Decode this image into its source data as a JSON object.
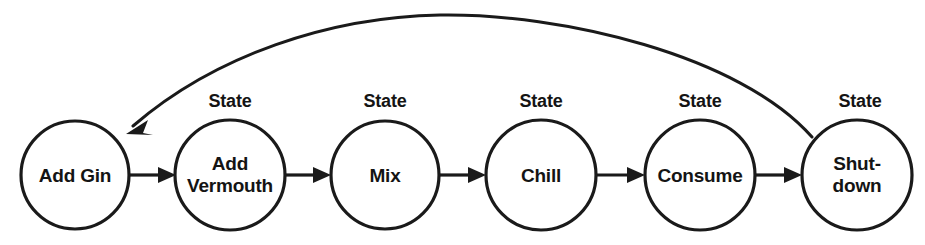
{
  "diagram": {
    "type": "state-machine",
    "title": "",
    "canvas": {
      "width": 925,
      "height": 245
    },
    "colors": {
      "background": "#ffffff",
      "stroke": "#1a1a1a",
      "text": "#141414"
    },
    "state_caption": "State",
    "nodes": [
      {
        "id": "add-gin",
        "label_lines": [
          "Add Gin"
        ],
        "caption": "",
        "has_caption": false,
        "cx": 75,
        "cy": 175,
        "r": 54
      },
      {
        "id": "add-vermouth",
        "label_lines": [
          "Add",
          "Vermouth"
        ],
        "caption": "State",
        "has_caption": true,
        "cx": 230,
        "cy": 175,
        "r": 55
      },
      {
        "id": "mix",
        "label_lines": [
          "Mix"
        ],
        "caption": "State",
        "has_caption": true,
        "cx": 385,
        "cy": 175,
        "r": 54
      },
      {
        "id": "chill",
        "label_lines": [
          "Chill"
        ],
        "caption": "State",
        "has_caption": true,
        "cx": 541,
        "cy": 175,
        "r": 55
      },
      {
        "id": "consume",
        "label_lines": [
          "Consume"
        ],
        "caption": "State",
        "has_caption": true,
        "cx": 700,
        "cy": 175,
        "r": 55
      },
      {
        "id": "shutdown",
        "label_lines": [
          "Shut-",
          "down"
        ],
        "caption": "State",
        "has_caption": true,
        "cx": 857,
        "cy": 175,
        "r": 55
      }
    ],
    "transitions": [
      {
        "id": "t1",
        "from": "add-gin",
        "to": "add-vermouth",
        "label": "",
        "shape": "straight"
      },
      {
        "id": "t2",
        "from": "add-vermouth",
        "to": "mix",
        "label": "",
        "shape": "straight"
      },
      {
        "id": "t3",
        "from": "mix",
        "to": "chill",
        "label": "",
        "shape": "straight"
      },
      {
        "id": "t4",
        "from": "chill",
        "to": "consume",
        "label": "",
        "shape": "straight"
      },
      {
        "id": "t5",
        "from": "consume",
        "to": "shutdown",
        "label": "",
        "shape": "straight"
      },
      {
        "id": "t6",
        "from": "shutdown",
        "to": "add-gin",
        "label": "",
        "shape": "curved-feedback"
      }
    ]
  }
}
